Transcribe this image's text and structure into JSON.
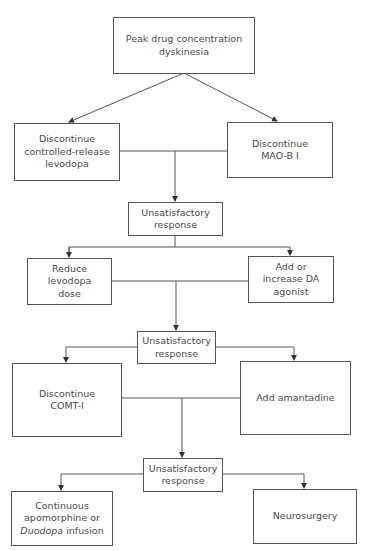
{
  "diagram": {
    "type": "flowchart",
    "nodes": {
      "start": {
        "lines": [
          "Peak drug concentration",
          "dyskinesia"
        ]
      },
      "discontinue_cr_levodopa": {
        "lines": [
          "Discontinue",
          "controlled-release",
          "levodopa"
        ]
      },
      "discontinue_maob": {
        "lines": [
          "Discontinue",
          "MAO-B I"
        ]
      },
      "unsatisfactory_1": {
        "lines": [
          "Unsatisfactory",
          "response"
        ]
      },
      "reduce_levodopa": {
        "lines": [
          "Reduce",
          "levodopa",
          "dose"
        ]
      },
      "add_da_agonist": {
        "lines": [
          "Add or",
          "increase DA",
          "agonist"
        ]
      },
      "unsatisfactory_2": {
        "lines": [
          "Unsatisfactory",
          "response"
        ]
      },
      "discontinue_comt": {
        "lines": [
          "Discontinue",
          "COMT-I"
        ]
      },
      "add_amantadine": {
        "lines": [
          "Add amantadine"
        ]
      },
      "unsatisfactory_3": {
        "lines": [
          "Unsatisfactory",
          "response"
        ]
      },
      "continuous_apomorphine": {
        "line1": "Continuous",
        "line2": "apomorphine or",
        "line3_italic": "Duodopa",
        "line3_rest": " infusion"
      },
      "neurosurgery": {
        "lines": [
          "Neurosurgery"
        ]
      }
    },
    "edges": [
      [
        "start",
        "discontinue_cr_levodopa"
      ],
      [
        "start",
        "discontinue_maob"
      ],
      [
        "discontinue_cr_levodopa+discontinue_maob",
        "unsatisfactory_1"
      ],
      [
        "unsatisfactory_1",
        "reduce_levodopa"
      ],
      [
        "unsatisfactory_1",
        "add_da_agonist"
      ],
      [
        "reduce_levodopa+add_da_agonist",
        "unsatisfactory_2"
      ],
      [
        "unsatisfactory_2",
        "discontinue_comt"
      ],
      [
        "unsatisfactory_2",
        "add_amantadine"
      ],
      [
        "discontinue_comt+add_amantadine",
        "unsatisfactory_3"
      ],
      [
        "unsatisfactory_3",
        "continuous_apomorphine"
      ],
      [
        "unsatisfactory_3",
        "neurosurgery"
      ]
    ],
    "colors": {
      "line": "#555555",
      "text": "#4a4a4a",
      "background": "#ffffff"
    }
  }
}
